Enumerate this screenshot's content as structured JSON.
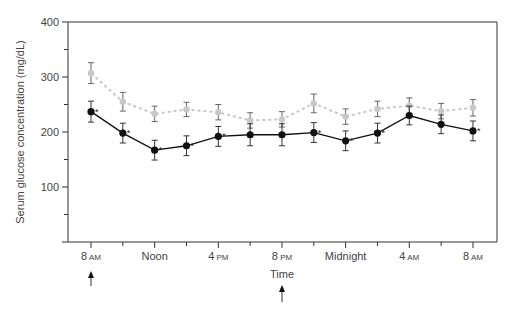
{
  "chart_data": {
    "type": "line",
    "title": "",
    "xlabel": "Time",
    "ylabel": "Serum glucose concentration (mg/dL)",
    "ylim": [
      0,
      400
    ],
    "yticks": [
      100,
      200,
      300,
      400
    ],
    "yminor_ticks": [
      50,
      150,
      250,
      350
    ],
    "grid": false,
    "legend": null,
    "x_tick_labels": [
      {
        "main": "8",
        "suffix": "AM"
      },
      {
        "main": "Noon",
        "suffix": ""
      },
      {
        "main": "4",
        "suffix": "PM"
      },
      {
        "main": "8",
        "suffix": "PM"
      },
      {
        "main": "Midnight",
        "suffix": ""
      },
      {
        "main": "4",
        "suffix": "AM"
      },
      {
        "main": "8",
        "suffix": "AM"
      }
    ],
    "x": [
      "8 AM",
      "10 AM",
      "Noon",
      "2 PM",
      "4 PM",
      "6 PM",
      "8 PM",
      "10 PM",
      "Midnight",
      "2 AM",
      "4 AM",
      "6 AM",
      "8 AM"
    ],
    "series": [
      {
        "name": "gray (dashed)",
        "color": "#c8c8c8",
        "line_style": "dashed",
        "values": [
          307,
          255,
          233,
          241,
          236,
          221,
          223,
          252,
          228,
          242,
          248,
          238,
          244
        ],
        "error": [
          19,
          17,
          14,
          13,
          14,
          14,
          14,
          17,
          14,
          14,
          14,
          14,
          15
        ]
      },
      {
        "name": "black (solid)",
        "color": "#111111",
        "line_style": "solid",
        "values": [
          237,
          198,
          167,
          175,
          192,
          195,
          195,
          199,
          184,
          198,
          230,
          214,
          202
        ],
        "error": [
          19,
          18,
          18,
          18,
          18,
          20,
          20,
          18,
          18,
          18,
          17,
          17,
          18
        ],
        "significant": [
          true,
          true,
          true,
          true,
          true,
          false,
          false,
          true,
          true,
          true,
          false,
          false,
          true
        ]
      }
    ],
    "annotations": [
      {
        "type": "arrow",
        "at": "8 AM",
        "direction": "up"
      },
      {
        "type": "arrow",
        "at": "8 PM",
        "direction": "up"
      },
      {
        "type": "marker",
        "text": "*",
        "meaning": "significant difference"
      }
    ]
  }
}
